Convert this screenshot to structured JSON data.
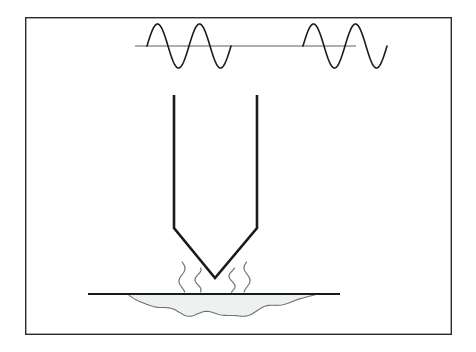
{
  "figure": {
    "background_color": "#ffffff",
    "canvas": {
      "width": 476,
      "height": 352
    }
  },
  "frame": {
    "name": "figure-border",
    "x": 25,
    "y": 17,
    "width": 427,
    "height": 318,
    "stroke_color": "#2b2b2b",
    "stroke_width": 1.4,
    "fill": "none"
  },
  "signal": {
    "label": "ultrasonic-sine-signal",
    "axis": {
      "name": "signal-baseline",
      "x1": 135,
      "x2": 356,
      "y": 46,
      "stroke_color": "#5a5f63",
      "stroke_width": 1.2
    },
    "stroke_color": "#1a1a1a",
    "stroke_width": 1.6,
    "amplitude": 22,
    "wavelength": 42,
    "groups": [
      {
        "name": "wave-group-left",
        "start_x": 147,
        "cycles": 2
      },
      {
        "name": "wave-group-right",
        "start_x": 303,
        "cycles": 2
      }
    ]
  },
  "horn": {
    "label": "ultrasonic-horn-probe",
    "stroke_color": "#1a1a1a",
    "stroke_width": 2.6,
    "left_x": 174,
    "right_x": 257,
    "top_y": 95,
    "shoulder_y": 228,
    "tip_x": 215,
    "tip_y": 278
  },
  "vibration": {
    "label": "vibration-squiggles",
    "stroke_color": "#6b7073",
    "stroke_width": 1.2,
    "count": 4,
    "marks": [
      {
        "name": "squiggle-left-outer",
        "x": 182,
        "y_top": 262,
        "y_bottom": 292
      },
      {
        "name": "squiggle-left-inner",
        "x": 198,
        "y_top": 268,
        "y_bottom": 292
      },
      {
        "name": "squiggle-right-inner",
        "x": 232,
        "y_top": 268,
        "y_bottom": 292
      },
      {
        "name": "squiggle-right-outer",
        "x": 247,
        "y_top": 262,
        "y_bottom": 292
      }
    ]
  },
  "workpiece": {
    "label": "workpiece-surface",
    "surface_line": {
      "name": "substrate-surface-line",
      "x1": 88,
      "x2": 340,
      "y": 294,
      "stroke_color": "#1a1a1a",
      "stroke_width": 2.0
    }
  },
  "melt_pool": {
    "label": "molten-weld-pool",
    "fill_color": "#eef1f2",
    "stroke_color": "#6b7073",
    "stroke_width": 1.1,
    "left_x": 128,
    "right_x": 318,
    "top_y": 294,
    "max_depth_y": 320
  },
  "palette": {
    "ink": "#1a1a1a",
    "grey_ink": "#6b7073",
    "frame": "#2b2b2b",
    "pool_fill": "#eef1f2",
    "paper": "#ffffff"
  }
}
